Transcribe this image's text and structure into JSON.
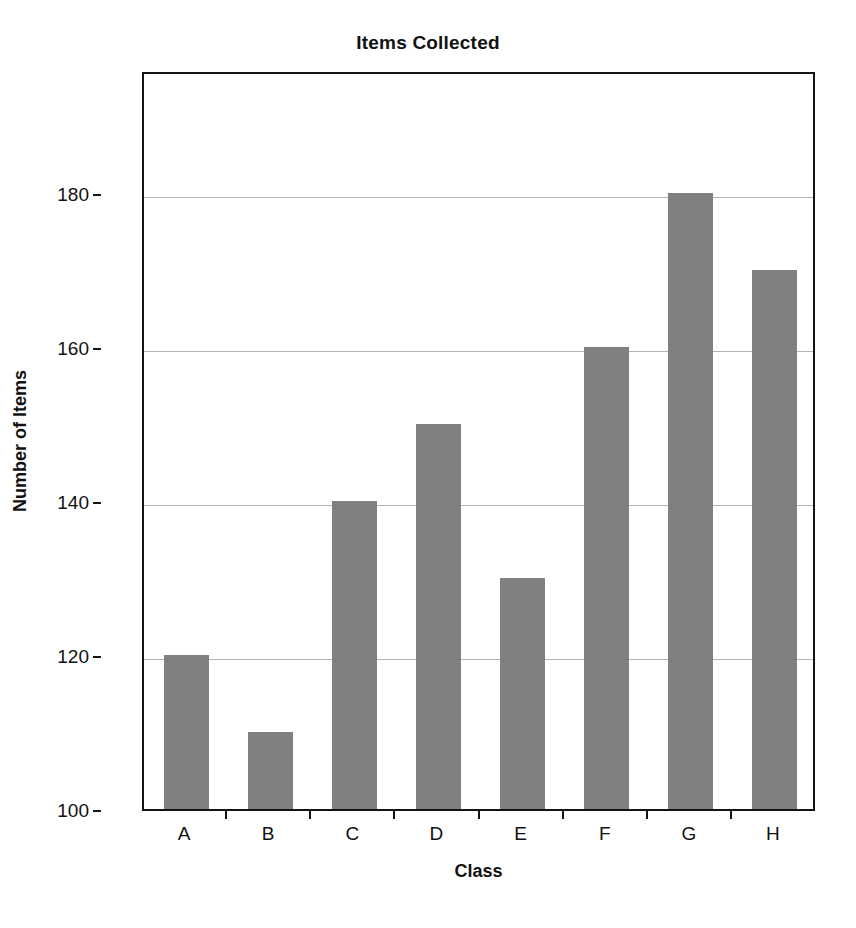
{
  "chart_data": {
    "type": "bar",
    "title": "Items Collected",
    "xlabel": "Class",
    "ylabel": "Number of Items",
    "categories": [
      "A",
      "B",
      "C",
      "D",
      "E",
      "F",
      "G",
      "H"
    ],
    "values": [
      120,
      110,
      140,
      150,
      130,
      160,
      180,
      170
    ],
    "ylim": [
      100,
      196
    ],
    "yticks": [
      100,
      120,
      140,
      160,
      180
    ],
    "ytick_labels": [
      "100",
      "120",
      "140",
      "160",
      "180"
    ],
    "gridlines": [
      120,
      140,
      160,
      180
    ],
    "grid": true,
    "legend": false,
    "bar_color": "#808080",
    "grid_color": "#b4b4b4",
    "axis_color": "#141414",
    "background_color": "#ffffff"
  }
}
